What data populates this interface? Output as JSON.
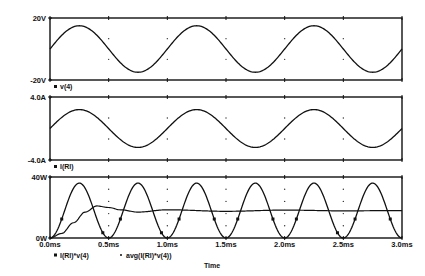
{
  "chart_data": [
    {
      "type": "line",
      "title": "",
      "xlabel": "Time",
      "ylabel": "",
      "ylim": [
        -20,
        20
      ],
      "ytick_labels": [
        "20V",
        "-20V"
      ],
      "xlim": [
        0,
        3.0
      ],
      "x_unit": "ms",
      "grid": "dots",
      "series": [
        {
          "name": "v(4)",
          "function": "15*sin(2*pi*t/1.0ms)",
          "amplitude": 15,
          "period_ms": 1.0,
          "offset": 0,
          "unit": "V"
        }
      ],
      "legend": [
        "v(4)"
      ]
    },
    {
      "type": "line",
      "title": "",
      "xlabel": "Time",
      "ylim": [
        -4.0,
        4.0
      ],
      "ytick_labels": [
        "4.0A",
        "-4.0A"
      ],
      "xlim": [
        0,
        3.0
      ],
      "x_unit": "ms",
      "grid": "dots",
      "series": [
        {
          "name": "I(Rl)",
          "function": "2.4*sin(2*pi*t/1.0ms)",
          "amplitude": 2.4,
          "period_ms": 1.0,
          "offset": 0,
          "unit": "A"
        }
      ],
      "legend": [
        "I(Rl)"
      ]
    },
    {
      "type": "line",
      "title": "",
      "xlabel": "Time",
      "ylim": [
        0,
        40
      ],
      "ytick_labels": [
        "40W",
        "0W"
      ],
      "xlim": [
        0,
        3.0
      ],
      "x_unit": "ms",
      "xtick_labels": [
        "0.0ms",
        "0.5ms",
        "1.0ms",
        "1.5ms",
        "2.0ms",
        "2.5ms",
        "3.0ms"
      ],
      "grid": "dots",
      "series": [
        {
          "name": "I(Rl)*v(4)",
          "marker": "square",
          "peak": 36,
          "period_ms": 0.5,
          "x": [
            0,
            0.125,
            0.25,
            0.375,
            0.5,
            0.625,
            0.75,
            0.875,
            1.0
          ],
          "values": [
            0,
            18,
            36,
            18,
            0,
            18,
            36,
            18,
            0
          ]
        },
        {
          "name": "avg(I(Rl)*v(4))",
          "marker": "dot",
          "x": [
            0,
            0.1,
            0.2,
            0.3,
            0.4,
            0.5,
            0.6,
            0.75,
            1.0,
            1.5,
            2.0,
            2.5,
            3.0
          ],
          "values": [
            0,
            3,
            10,
            17,
            21,
            20,
            18.5,
            17,
            18.5,
            17.5,
            18.3,
            17.8,
            18
          ]
        }
      ],
      "legend": [
        "I(Rl)*v(4)",
        "avg(I(Rl)*v(4))"
      ]
    }
  ],
  "plots": {
    "p1": {
      "ytop": "20V",
      "ybot": "-20V",
      "legend": "v(4)"
    },
    "p2": {
      "ytop": "4.0A",
      "ybot": "-4.0A",
      "legend": "I(Rl)"
    },
    "p3": {
      "ytop": "40W",
      "ybot": "0W",
      "legend1": "I(Rl)*v(4)",
      "legend2": "avg(I(Rl)*v(4))"
    }
  },
  "xaxis": {
    "ticks": [
      "0.0ms",
      "0.5ms",
      "1.0ms",
      "1.5ms",
      "2.0ms",
      "2.5ms",
      "3.0ms"
    ],
    "label": "Time"
  }
}
